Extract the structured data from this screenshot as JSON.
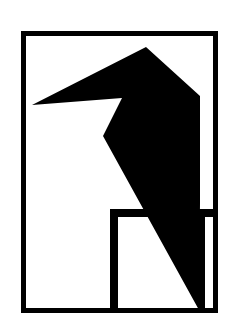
{
  "artwork": {
    "title": "Woodpecker Silhouette Logo",
    "alt_text": "Black geometric bird silhouette inside a rectangular frame",
    "colors": {
      "ink": "#000000",
      "paper": "#ffffff",
      "watermark": "rgba(60,60,60,0.085)"
    },
    "canvas": {
      "width": 237,
      "height": 334
    },
    "frame": {
      "name": "outer-rectangle-frame",
      "x": 21,
      "y": 31,
      "width": 197,
      "height": 282,
      "stroke_width": 5
    },
    "bird": {
      "name": "bird-silhouette",
      "points": "146,47 200,96 200,203 199,310 103,136 122,98 32,105",
      "head_apex": [
        146,
        47
      ],
      "beak_tip": [
        32,
        105
      ],
      "throat_notch": [
        103,
        136
      ],
      "tail_tip": [
        199,
        310
      ],
      "shoulder_right": [
        200,
        96
      ]
    },
    "legs": {
      "name": "perch-structure",
      "crossbar": {
        "x": 110,
        "y": 209,
        "width": 108,
        "height": 8
      },
      "left_post": {
        "x": 110,
        "y": 209,
        "width": 8,
        "height": 100
      },
      "right_post": {
        "x": 199,
        "y": 209,
        "width": 6,
        "height": 100
      }
    },
    "watermark": {
      "text": "Index Pages",
      "visible": true
    }
  }
}
